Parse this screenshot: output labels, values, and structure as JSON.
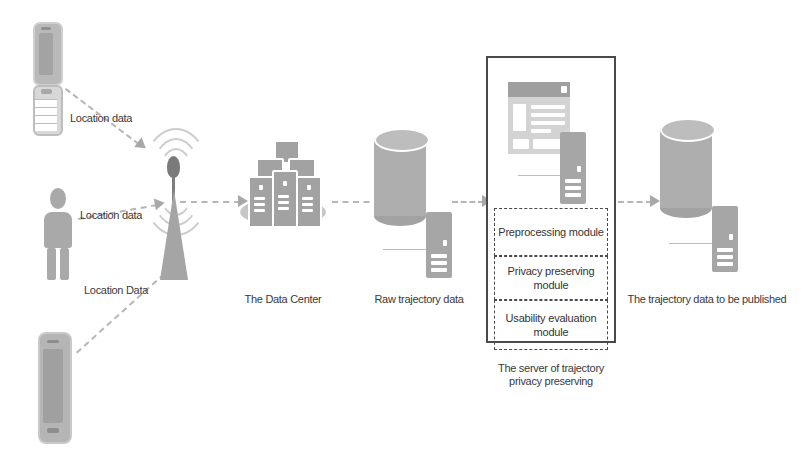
{
  "diagram": {
    "colors": {
      "fill_gray": "#a8a8a8",
      "light_gray": "#cdcdcd",
      "dark_border": "#4a4a4a",
      "arrow_gray": "#b6b6b6",
      "text": "#3a3a3a",
      "background": "#ffffff"
    },
    "sources": [
      {
        "id": "flip-phone",
        "icon": "mobile-phone-icon",
        "edge_label": "Location data"
      },
      {
        "id": "person",
        "icon": "person-icon",
        "edge_label": "Location data"
      },
      {
        "id": "smartphone",
        "icon": "smartphone-icon",
        "edge_label": "Location Data"
      }
    ],
    "tower": {
      "icon": "cell-tower-icon",
      "label": ""
    },
    "stages": [
      {
        "id": "data-center",
        "icon": "data-center-icon",
        "label": "The Data Center"
      },
      {
        "id": "raw-trajectory",
        "icon": "database-cylinder-icon",
        "label": "Raw trajectory data"
      },
      {
        "id": "published-trajectory",
        "icon": "database-cylinder-icon",
        "label": "The trajectory data to be published"
      }
    ],
    "server": {
      "caption_line1": "The server of trajectory",
      "caption_line2": "privacy preserving",
      "window_icon": "application-window-icon",
      "server_icon": "server-rack-icon",
      "modules": [
        {
          "id": "preprocessing",
          "label": "Preprocessing module"
        },
        {
          "id": "privacy-preserving",
          "label": "Privacy preserving module"
        },
        {
          "id": "usability-evaluation",
          "label": "Usability evaluation module"
        }
      ]
    }
  }
}
